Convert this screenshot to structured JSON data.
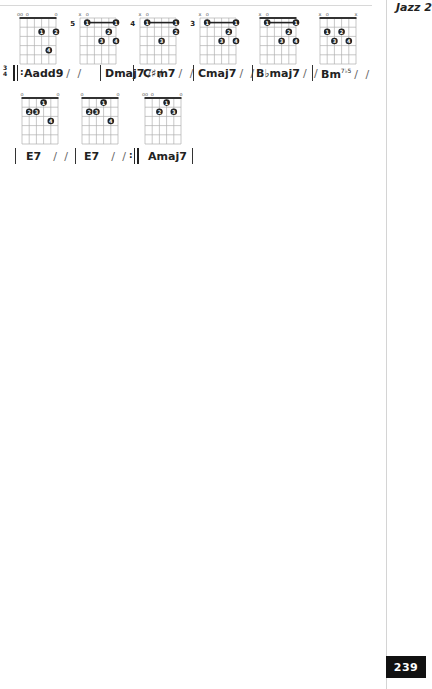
{
  "page": {
    "running_head": "Jazz 2",
    "page_number": "239",
    "colors": {
      "ink": "#222222",
      "grid": "#b8b8b8",
      "tab_bg": "#111111",
      "tab_fg": "#ffffff"
    }
  },
  "chords": [
    {
      "name": "Aadd9",
      "x": 20,
      "y": 10,
      "fret_label": "",
      "nut": true,
      "top_marks": [
        "oo",
        "o",
        "",
        "",
        "",
        "o"
      ],
      "barre": null,
      "dots": [
        {
          "string": 3,
          "fret": 2,
          "finger": "1"
        },
        {
          "string": 5,
          "fret": 2,
          "finger": "2"
        },
        {
          "string": 4,
          "fret": 4,
          "finger": "4"
        }
      ]
    },
    {
      "name": "Dmaj7",
      "x": 80,
      "y": 10,
      "fret_label": "5",
      "nut": false,
      "top_marks": [
        "x",
        "o",
        "",
        "",
        "",
        ""
      ],
      "barre": {
        "from": 1,
        "to": 5,
        "fret": 1,
        "finger": "1"
      },
      "dots": [
        {
          "string": 4,
          "fret": 2,
          "finger": "2"
        },
        {
          "string": 3,
          "fret": 3,
          "finger": "3"
        },
        {
          "string": 5,
          "fret": 3,
          "finger": "4"
        }
      ]
    },
    {
      "name": "C♯m7",
      "x": 140,
      "y": 10,
      "fret_label": "4",
      "nut": false,
      "top_marks": [
        "x",
        "o",
        "",
        "",
        "",
        ""
      ],
      "barre": {
        "from": 1,
        "to": 5,
        "fret": 1,
        "finger": "1"
      },
      "dots": [
        {
          "string": 5,
          "fret": 2,
          "finger": "2"
        },
        {
          "string": 3,
          "fret": 3,
          "finger": "3"
        }
      ]
    },
    {
      "name": "Cmaj7",
      "x": 200,
      "y": 10,
      "fret_label": "3",
      "nut": false,
      "top_marks": [
        "x",
        "o",
        "",
        "",
        "",
        ""
      ],
      "barre": {
        "from": 1,
        "to": 5,
        "fret": 1,
        "finger": "1"
      },
      "dots": [
        {
          "string": 4,
          "fret": 2,
          "finger": "2"
        },
        {
          "string": 3,
          "fret": 3,
          "finger": "3"
        },
        {
          "string": 5,
          "fret": 3,
          "finger": "4"
        }
      ]
    },
    {
      "name": "B♭maj7",
      "x": 260,
      "y": 10,
      "fret_label": "",
      "nut": true,
      "top_marks": [
        "x",
        "o",
        "",
        "",
        "",
        ""
      ],
      "barre": {
        "from": 1,
        "to": 5,
        "fret": 1,
        "finger": "1"
      },
      "dots": [
        {
          "string": 4,
          "fret": 2,
          "finger": "2"
        },
        {
          "string": 3,
          "fret": 3,
          "finger": "3"
        },
        {
          "string": 5,
          "fret": 3,
          "finger": "4"
        }
      ]
    },
    {
      "name": "Bm7♭5",
      "x": 320,
      "y": 10,
      "fret_label": "",
      "nut": true,
      "top_marks": [
        "x",
        "o",
        "",
        "",
        "",
        "x"
      ],
      "barre": null,
      "dots": [
        {
          "string": 1,
          "fret": 2,
          "finger": "1"
        },
        {
          "string": 3,
          "fret": 2,
          "finger": "2"
        },
        {
          "string": 2,
          "fret": 3,
          "finger": "3"
        },
        {
          "string": 4,
          "fret": 3,
          "finger": "4"
        }
      ]
    },
    {
      "name": "E7",
      "x": 22,
      "y": 90,
      "fret_label": "",
      "nut": true,
      "top_marks": [
        "o",
        "",
        "",
        "",
        "",
        "o"
      ],
      "barre": null,
      "dots": [
        {
          "string": 3,
          "fret": 1,
          "finger": "1"
        },
        {
          "string": 1,
          "fret": 2,
          "finger": "2"
        },
        {
          "string": 2,
          "fret": 2,
          "finger": "3"
        },
        {
          "string": 4,
          "fret": 3,
          "finger": "4"
        }
      ]
    },
    {
      "name": "E7",
      "x": 82,
      "y": 90,
      "fret_label": "",
      "nut": true,
      "top_marks": [
        "o",
        "",
        "",
        "",
        "",
        "o"
      ],
      "barre": null,
      "dots": [
        {
          "string": 3,
          "fret": 1,
          "finger": "1"
        },
        {
          "string": 1,
          "fret": 2,
          "finger": "2"
        },
        {
          "string": 2,
          "fret": 2,
          "finger": "3"
        },
        {
          "string": 4,
          "fret": 3,
          "finger": "4"
        }
      ]
    },
    {
      "name": "Amaj7",
      "x": 145,
      "y": 90,
      "fret_label": "",
      "nut": true,
      "top_marks": [
        "oo",
        "o",
        "",
        "",
        "",
        "o"
      ],
      "barre": null,
      "dots": [
        {
          "string": 3,
          "fret": 1,
          "finger": "1"
        },
        {
          "string": 2,
          "fret": 2,
          "finger": "2"
        },
        {
          "string": 4,
          "fret": 2,
          "finger": "3"
        }
      ]
    }
  ],
  "progression": {
    "time_signature": {
      "top": "3",
      "bottom": "4"
    },
    "line1": [
      {
        "chord": "Aadd9",
        "slashes": "/ /"
      },
      {
        "chord": "Dmaj7",
        "slashes": "/ /"
      },
      {
        "chord": "C♯m7",
        "slashes": "/ /"
      },
      {
        "chord": "Cmaj7",
        "slashes": "/ /"
      },
      {
        "chord": "B♭maj7",
        "slashes": "/ /"
      },
      {
        "chord": "Bm",
        "superscript": "7♭5",
        "slashes": "/ /"
      }
    ],
    "line2": [
      {
        "chord": "E7",
        "slashes": "/ /"
      },
      {
        "chord": "E7",
        "slashes": "/ /"
      },
      {
        "chord": "Amaj7",
        "slashes": ""
      }
    ]
  }
}
